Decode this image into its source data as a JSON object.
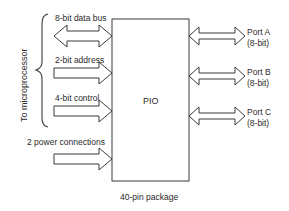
{
  "diagram": {
    "chip_label": "PIO",
    "package_label": "40-pin package",
    "side_label": "To microprocessor",
    "left_signals": [
      {
        "label": "8-bit data bus",
        "direction": "bidirectional"
      },
      {
        "label": "2-bit address",
        "direction": "in"
      },
      {
        "label": "4-bit control",
        "direction": "in"
      },
      {
        "label": "2 power connections",
        "direction": "in"
      }
    ],
    "ports": [
      {
        "name": "Port A",
        "width": "(8-bit)",
        "direction": "bidirectional"
      },
      {
        "name": "Port B",
        "width": "(8-bit)",
        "direction": "bidirectional"
      },
      {
        "name": "Port C",
        "width": "(8-bit)",
        "direction": "bidirectional"
      }
    ],
    "colors": {
      "stroke": "#3a3a3a",
      "text": "#2a2a2a",
      "background": "#ffffff"
    }
  }
}
